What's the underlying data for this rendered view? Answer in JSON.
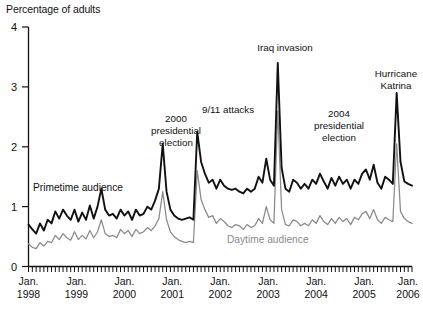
{
  "chart_data": {
    "type": "line",
    "title": "",
    "ylabel": "Percentage of adults",
    "xlabel": "",
    "ylim": [
      0,
      4
    ],
    "yticks": [
      0,
      1,
      2,
      3,
      4
    ],
    "ytick_labels": [
      "0",
      "1",
      "2",
      "3",
      "4"
    ],
    "grid": false,
    "legend": "inline-annotations",
    "x_start": "1998-01",
    "x_end": "2006-01",
    "x_frequency": "monthly",
    "xtick_labels": [
      {
        "line1": "Jan.",
        "line2": "1998"
      },
      {
        "line1": "Jan.",
        "line2": "1999"
      },
      {
        "line1": "Jan.",
        "line2": "2000"
      },
      {
        "line1": "Jan.",
        "line2": "2001"
      },
      {
        "line1": "Jan.",
        "line2": "2002"
      },
      {
        "line1": "Jan.",
        "line2": "2003"
      },
      {
        "line1": "Jan.",
        "line2": "2004"
      },
      {
        "line1": "Jan.",
        "line2": "2005"
      },
      {
        "line1": "Jan.",
        "line2": "2006"
      }
    ],
    "colors": {
      "primetime": "#111111",
      "daytime": "#8a8a8a",
      "axis": "#111111"
    },
    "series": [
      {
        "name": "Primetime audience",
        "color": "#111111",
        "values": [
          0.7,
          0.62,
          0.55,
          0.72,
          0.6,
          0.78,
          0.72,
          0.92,
          0.8,
          0.95,
          0.85,
          0.78,
          0.95,
          0.75,
          0.9,
          0.78,
          1.02,
          0.8,
          1.0,
          1.3,
          0.95,
          0.85,
          0.88,
          0.8,
          0.95,
          0.85,
          0.92,
          0.78,
          0.95,
          0.85,
          0.88,
          1.0,
          0.95,
          1.1,
          1.3,
          2.05,
          1.25,
          0.95,
          0.85,
          0.8,
          0.78,
          0.8,
          0.82,
          0.78,
          2.25,
          1.75,
          1.55,
          1.4,
          1.45,
          1.3,
          1.45,
          1.35,
          1.3,
          1.28,
          1.3,
          1.25,
          1.22,
          1.3,
          1.25,
          1.3,
          1.5,
          1.4,
          1.8,
          1.45,
          1.35,
          3.4,
          1.65,
          1.3,
          1.25,
          1.45,
          1.4,
          1.3,
          1.38,
          1.3,
          1.45,
          1.38,
          1.55,
          1.42,
          1.3,
          1.48,
          1.35,
          1.5,
          1.38,
          1.45,
          1.3,
          1.45,
          1.38,
          1.55,
          1.62,
          1.45,
          1.7,
          1.4,
          1.3,
          1.5,
          1.45,
          1.38,
          2.9,
          1.75,
          1.42,
          1.38,
          1.35
        ]
      },
      {
        "name": "Daytime audience",
        "color": "#8a8a8a",
        "values": [
          0.38,
          0.32,
          0.3,
          0.4,
          0.34,
          0.42,
          0.4,
          0.52,
          0.45,
          0.55,
          0.48,
          0.44,
          0.58,
          0.45,
          0.52,
          0.46,
          0.6,
          0.48,
          0.58,
          0.78,
          0.55,
          0.5,
          0.52,
          0.48,
          0.62,
          0.55,
          0.6,
          0.5,
          0.62,
          0.55,
          0.58,
          0.65,
          0.6,
          0.68,
          0.8,
          1.25,
          0.78,
          0.58,
          0.5,
          0.45,
          0.42,
          0.4,
          0.42,
          0.4,
          1.6,
          1.12,
          0.95,
          0.82,
          0.85,
          0.72,
          0.8,
          0.75,
          0.68,
          0.65,
          0.7,
          0.68,
          0.62,
          0.7,
          0.65,
          0.68,
          0.8,
          0.72,
          1.0,
          0.78,
          0.72,
          2.6,
          0.95,
          0.7,
          0.68,
          0.78,
          0.75,
          0.68,
          0.72,
          0.68,
          0.78,
          0.72,
          0.85,
          0.75,
          0.7,
          0.8,
          0.72,
          0.82,
          0.75,
          0.8,
          0.7,
          0.82,
          0.78,
          0.88,
          0.92,
          0.8,
          0.95,
          0.78,
          0.72,
          0.82,
          0.78,
          0.75,
          2.05,
          0.92,
          0.8,
          0.75,
          0.72
        ]
      }
    ],
    "annotations": [
      {
        "text": [
          "Primetime audience"
        ],
        "series": "Primetime audience"
      },
      {
        "text": [
          "Daytime audience"
        ],
        "series": "Daytime audience"
      },
      {
        "text": [
          "2000",
          "presidential",
          "election"
        ],
        "event_index": 35
      },
      {
        "text": [
          "9/11 attacks"
        ],
        "event_index": 44
      },
      {
        "text": [
          "Iraq invasion"
        ],
        "event_index": 65
      },
      {
        "text": [
          "2004",
          "presidential",
          "election"
        ],
        "event_index": 88
      },
      {
        "text": [
          "Hurricane",
          "Katrina"
        ],
        "event_index": 96
      }
    ]
  },
  "labels": {
    "axis_title": "Percentage of adults",
    "primetime": "Primetime audience",
    "daytime": "Daytime audience",
    "annot_2000_l1": "2000",
    "annot_2000_l2": "presidential",
    "annot_2000_l3": "election",
    "annot_911": "9/11 attacks",
    "annot_iraq": "Iraq invasion",
    "annot_2004_l1": "2004",
    "annot_2004_l2": "presidential",
    "annot_2004_l3": "election",
    "annot_katrina_l1": "Hurricane",
    "annot_katrina_l2": "Katrina",
    "y0": "0",
    "y1": "1",
    "y2": "2",
    "y3": "3",
    "y4": "4",
    "x1998a": "Jan.",
    "x1998b": "1998",
    "x1999a": "Jan.",
    "x1999b": "1999",
    "x2000a": "Jan.",
    "x2000b": "2000",
    "x2001a": "Jan.",
    "x2001b": "2001",
    "x2002a": "Jan.",
    "x2002b": "2002",
    "x2003a": "Jan.",
    "x2003b": "2003",
    "x2004a": "Jan.",
    "x2004b": "2004",
    "x2005a": "Jan.",
    "x2005b": "2005",
    "x2006a": "Jan.",
    "x2006b": "2006"
  }
}
